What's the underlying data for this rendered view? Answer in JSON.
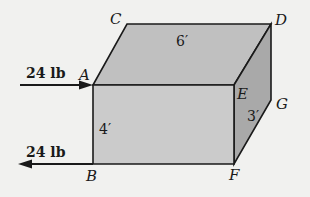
{
  "diagram": {
    "type": "3d-box-free-body",
    "colors": {
      "background": "#f1f1ef",
      "front_face": "#cbcbcb",
      "top_face": "#c0c0c0",
      "side_face": "#a9a9a9",
      "stroke": "#1a1a1a"
    },
    "vertices": {
      "A": "A",
      "B": "B",
      "C": "C",
      "D": "D",
      "E": "E",
      "F": "F",
      "G": "G"
    },
    "dimensions": {
      "length": "6′",
      "height": "4′",
      "depth": "3′"
    },
    "forces": [
      {
        "label": "24 lb",
        "at": "A",
        "direction": "right"
      },
      {
        "label": "24 lb",
        "at": "B",
        "direction": "left"
      }
    ]
  }
}
